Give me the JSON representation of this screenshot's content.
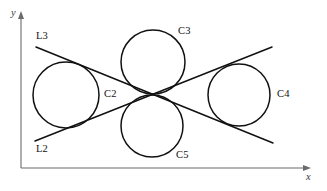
{
  "figure": {
    "width": 327,
    "height": 191,
    "background": "#ffffff",
    "stroke_color": "#111111",
    "axis_color": "#6b6b6b"
  },
  "axes": {
    "x_label": "x",
    "y_label": "y",
    "origin": {
      "x": 21,
      "y": 168
    },
    "x_axis_end": {
      "x": 311,
      "y": 168
    },
    "y_axis_end": {
      "x": 21,
      "y": 13
    }
  },
  "labels": {
    "l3": "L3",
    "l2": "L2",
    "c2": "C2",
    "c3": "C3",
    "c4": "C4",
    "c5": "C5"
  },
  "chart_data": {
    "type": "diagram",
    "title": "",
    "circles": [
      {
        "name": "C2",
        "cx": 66,
        "cy": 95,
        "r": 33,
        "label_x": 104,
        "label_y": 89
      },
      {
        "name": "C3",
        "cx": 153,
        "cy": 62,
        "r": 32,
        "label_x": 178,
        "label_y": 26
      },
      {
        "name": "C4",
        "cx": 239,
        "cy": 95,
        "r": 31,
        "label_x": 277,
        "label_y": 89
      },
      {
        "name": "C5",
        "cx": 152,
        "cy": 126,
        "r": 31,
        "label_x": 176,
        "label_y": 150
      }
    ],
    "lines": [
      {
        "name": "L3",
        "x1": 36,
        "y1": 47,
        "x2": 273,
        "y2": 143,
        "label_x": 36,
        "label_y": 32,
        "note": "descending line from upper-left to lower-right"
      },
      {
        "name": "L2",
        "x1": 35,
        "y1": 141,
        "x2": 272,
        "y2": 47,
        "label_x": 36,
        "label_y": 144,
        "note": "ascending line from lower-left to upper-right"
      }
    ],
    "intersection": {
      "x": 153,
      "y": 95
    },
    "grid": false,
    "legend": "none"
  }
}
